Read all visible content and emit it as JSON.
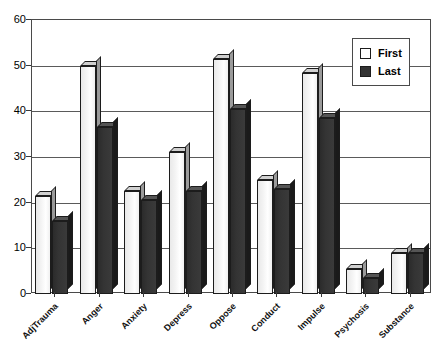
{
  "chart_data": {
    "type": "bar",
    "title": "",
    "subtitle": "",
    "xlabel": "",
    "ylabel": "",
    "ylim": [
      0,
      60
    ],
    "yticks": [
      0,
      10,
      20,
      30,
      40,
      50,
      60
    ],
    "grid": true,
    "legend_position": "top-right",
    "categories": [
      "AdjTrauma",
      "Anger",
      "Anxiety",
      "Depress",
      "Oppose",
      "Conduct",
      "Impulse",
      "Psychosis",
      "Substance"
    ],
    "series": [
      {
        "name": "First",
        "color": "#ffffff",
        "values": [
          21.5,
          50,
          22.5,
          31,
          51.5,
          25,
          48.5,
          5.5,
          9
        ]
      },
      {
        "name": "Last",
        "color": "#333333",
        "values": [
          16,
          36.5,
          20.5,
          22.5,
          40.5,
          23,
          38.5,
          3.5,
          9
        ]
      }
    ]
  },
  "legend": {
    "items": [
      {
        "label": "First",
        "swatch": "first"
      },
      {
        "label": "Last",
        "swatch": "last"
      }
    ]
  }
}
